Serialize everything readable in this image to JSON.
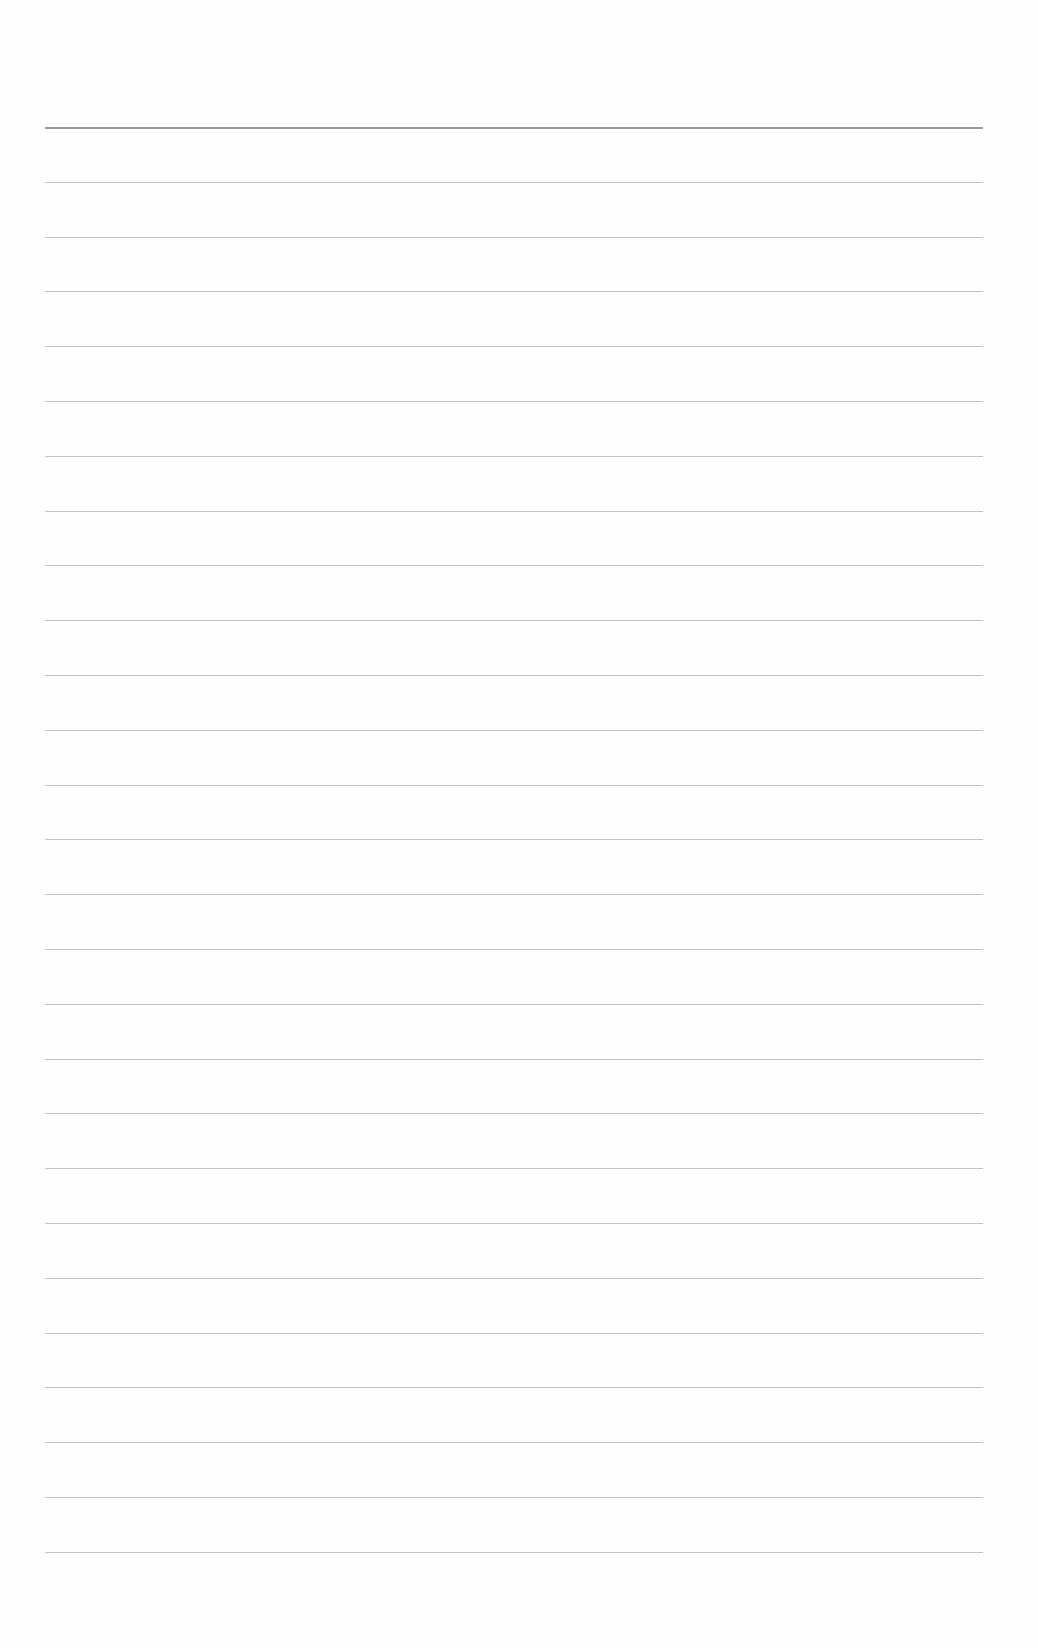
{
  "page": {
    "type": "blank ruled sheet",
    "background_color": "#fefefe",
    "line_color": "#b8b8b8",
    "line_count": 27,
    "first_line_y": 127,
    "line_spacing": 54.8,
    "line_left": 45,
    "line_right": 983,
    "text": ""
  }
}
